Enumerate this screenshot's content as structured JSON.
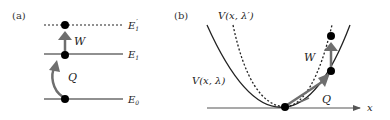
{
  "panel_a": {
    "label": "(a)",
    "levels": [
      {
        "name": "E0",
        "text": "E",
        "sub": "0",
        "sup": "",
        "style": "solid"
      },
      {
        "name": "E1",
        "text": "E",
        "sub": "1",
        "sup": "",
        "style": "solid"
      },
      {
        "name": "E1prime",
        "text": "E",
        "sub": "1",
        "sup": "′",
        "style": "dotted"
      }
    ],
    "arrows": {
      "work": "W",
      "heat": "Q"
    }
  },
  "panel_b": {
    "label": "(b)",
    "curve_initial": {
      "text": "V(x, λ)"
    },
    "curve_final": {
      "text": "V(x, λ′)"
    },
    "axis_label": "x",
    "arrows": {
      "work": "W",
      "heat": "Q"
    }
  },
  "colors": {
    "line": "#222222",
    "arrow": "#6e6e6e",
    "dot": "#000000"
  }
}
